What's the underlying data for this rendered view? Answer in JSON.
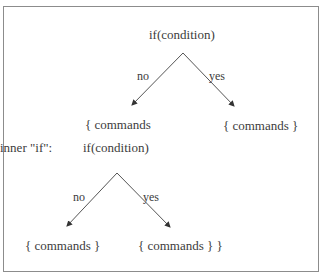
{
  "diagram": {
    "outer": {
      "condition": "if(condition)",
      "no_label": "no",
      "yes_label": "yes",
      "no_branch": "{ commands",
      "yes_branch": "{ commands }"
    },
    "inner": {
      "caption": "inner \"if\":",
      "condition": "if(condition)",
      "no_label": "no",
      "yes_label": "yes",
      "no_branch": "{ commands }",
      "yes_branch": "{ commands } }"
    },
    "colors": {
      "border": "#8c8c8c",
      "lines": "#555555",
      "text": "#3c3c3c"
    }
  }
}
